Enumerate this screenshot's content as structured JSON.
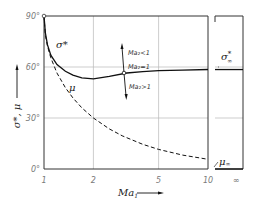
{
  "chart_data": {
    "type": "line",
    "title": "",
    "xlabel": "Ma1",
    "ylabel": "σ*, μ",
    "xscale": "log",
    "xlim": [
      1,
      10
    ],
    "ylim": [
      0,
      90
    ],
    "x_ticks": [
      "1",
      "2",
      "5",
      "10",
      "∞"
    ],
    "y_ticks": [
      "0°",
      "30°",
      "60°",
      "90°"
    ],
    "grid": true,
    "series": [
      {
        "name": "σ*",
        "style": "solid",
        "x": [
          1.0,
          1.02,
          1.05,
          1.1,
          1.2,
          1.35,
          1.5,
          1.7,
          2.0,
          2.5,
          3.2,
          4.0,
          5.0,
          7.0,
          10.0
        ],
        "values": [
          90,
          80,
          73,
          67,
          61.5,
          57.5,
          55.2,
          53.6,
          53.0,
          54.5,
          56.5,
          57.3,
          57.8,
          58.2,
          58.5
        ]
      },
      {
        "name": "μ",
        "style": "dashed",
        "x": [
          1.0,
          1.02,
          1.05,
          1.1,
          1.2,
          1.35,
          1.5,
          1.7,
          2.0,
          2.5,
          3.0,
          4.0,
          5.0,
          7.0,
          10.0
        ],
        "values": [
          90,
          78.6,
          72.2,
          65.4,
          56.4,
          47.8,
          41.8,
          36.0,
          30.0,
          23.6,
          19.5,
          14.5,
          11.5,
          8.2,
          5.7
        ]
      }
    ],
    "asymptotes": [
      {
        "name": "σ*∞",
        "value": 58.5
      },
      {
        "name": "μ∞",
        "value": 0
      }
    ],
    "annotations": [
      {
        "text": "Ma2<1",
        "position": "above marker on σ* curve, arrow up"
      },
      {
        "text": "Ma2=1",
        "position": "σ* curve near Ma1≈3.2, ~56.5°"
      },
      {
        "text": "Ma2>1",
        "position": "below marker on σ* curve, arrow down"
      }
    ]
  },
  "labels": {
    "sigma": "σ*",
    "mu": "μ",
    "sigma_inf": "σ",
    "sigma_inf_sup": "*",
    "sigma_inf_sub": "∞",
    "mu_inf": "μ",
    "mu_inf_sub": "∞",
    "ylabel": "σ*, μ",
    "xlabel": "Ma",
    "xlabel_sub": "1",
    "ma2_lt": "Ma₂<1",
    "ma2_eq": "Ma₂=1",
    "ma2_gt": "Ma₂>1"
  },
  "ticks": {
    "y": [
      "90°",
      "60°",
      "30°",
      "0°"
    ],
    "x": [
      "1",
      "2",
      "5",
      "10",
      "∞"
    ]
  }
}
